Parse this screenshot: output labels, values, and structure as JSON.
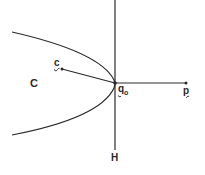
{
  "diagram": {
    "labels": {
      "region": "C",
      "point_c": "c",
      "vertex": "q",
      "vertex_sub": "o",
      "point_p": "p",
      "line": "H"
    },
    "colors": {
      "stroke": "#2a2a2a",
      "background": "#ffffff"
    }
  }
}
